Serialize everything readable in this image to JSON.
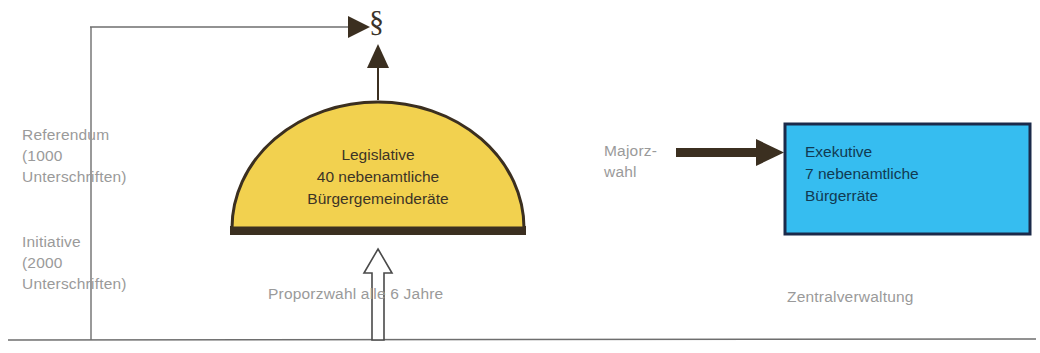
{
  "diagram": {
    "law_symbol": "§",
    "nodes": {
      "legislative": {
        "shape": "semicircle",
        "fill": "#F2D14F",
        "stroke": "#3B2F20",
        "text": "Legislative\n40 nebenamtliche\nBürgergemeinderäte",
        "lines": [
          "Legislative",
          "40 nebenamtliche",
          "Bürgergemeinderäte"
        ]
      },
      "exekutive": {
        "shape": "rectangle",
        "fill": "#36BDF0",
        "stroke": "#1B2A4A",
        "text": "Exekutive\n7 nebenamtliche\nBürgerräte",
        "lines": [
          "Exekutive",
          "7 nebenamtliche",
          "Bürgerräte"
        ]
      }
    },
    "labels": {
      "referendum": "Referendum\n(1000\nUnterschriften)",
      "initiative": "Initiative\n(2000\nUnterschriften)",
      "majorzwahl": "Majorz-\nwahl",
      "proporzwahl": "Proporzwahl alle 6 Jahre",
      "zentralverwaltung": "Zentralverwaltung"
    },
    "colors": {
      "yellow": "#F2D14F",
      "blue": "#36BDF0",
      "dark_arrow": "#3B2F20",
      "thin_line": "#6E6E6E",
      "label_gray": "#9A9A9A",
      "background": "#FFFFFF"
    },
    "connections": [
      {
        "from": "voters-line",
        "to": "law-symbol",
        "style": "thin-arrow",
        "direction": "right"
      },
      {
        "from": "legislative",
        "to": "law-symbol",
        "style": "thin-arrow",
        "direction": "up"
      },
      {
        "from": "legislative",
        "to": "exekutive",
        "style": "thick-arrow",
        "direction": "right",
        "label": "Majorz-\nwahl"
      },
      {
        "from": "voters-baseline",
        "to": "legislative",
        "style": "hollow-arrow",
        "direction": "up",
        "label": "Proporzwahl alle 6 Jahre"
      }
    ]
  }
}
